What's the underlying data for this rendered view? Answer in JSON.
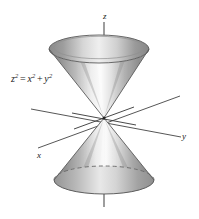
{
  "figure": {
    "surface_name": "double-cone",
    "equation": {
      "lhs_base": "z",
      "lhs_exp": "2",
      "equals": "=",
      "rhs1_base": "x",
      "rhs1_exp": "2",
      "plus": "+",
      "rhs2_base": "y",
      "rhs2_exp": "2",
      "plain": "z2 = x2 + y2"
    },
    "axes": [
      {
        "id": "z",
        "label": "z",
        "direction": "vertical-up"
      },
      {
        "id": "y",
        "label": "y",
        "direction": "right-slight-down"
      },
      {
        "id": "x",
        "label": "x",
        "direction": "lower-left"
      }
    ],
    "origin": {
      "x": 104,
      "y": 118
    },
    "upper_cone": {
      "name": "upper-nappe",
      "rim_center": {
        "x": 99,
        "y": 49
      },
      "rim_rx": 50,
      "rim_ry": 14
    },
    "lower_cone": {
      "name": "lower-nappe",
      "base_center": {
        "x": 104,
        "y": 180
      },
      "base_rx": 50,
      "base_ry": 14
    },
    "colors": {
      "background": "#ffffff",
      "ink": "#1a1a1a",
      "axis_line": "#4d4d4d",
      "surface_dark": "#8c8c8c",
      "surface_mid": "#b5b5b5",
      "surface_light": "#f2f2f2",
      "outline": "#5a5a5a",
      "hidden_dash": "#6b6b6b"
    }
  }
}
